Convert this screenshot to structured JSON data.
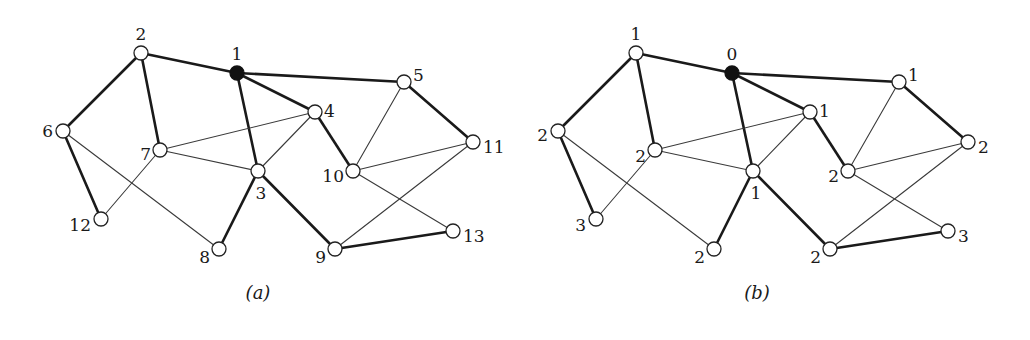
{
  "figure": {
    "panels": [
      {
        "id": "a",
        "caption": "(a)",
        "caption_pos": [
          258,
          299
        ],
        "offset_x": 0,
        "root": "1",
        "nodes": [
          {
            "id": "1",
            "x": 237,
            "y": 73,
            "label": "1",
            "lx": 237,
            "ly": 55,
            "anchor": "middle"
          },
          {
            "id": "2",
            "x": 141,
            "y": 53,
            "label": "2",
            "lx": 141,
            "ly": 35,
            "anchor": "middle"
          },
          {
            "id": "3",
            "x": 258,
            "y": 171,
            "label": "3",
            "lx": 261,
            "ly": 194,
            "anchor": "middle"
          },
          {
            "id": "4",
            "x": 315,
            "y": 112,
            "label": "4",
            "lx": 324,
            "ly": 112,
            "anchor": "start"
          },
          {
            "id": "5",
            "x": 404,
            "y": 82,
            "label": "5",
            "lx": 413,
            "ly": 76,
            "anchor": "start"
          },
          {
            "id": "6",
            "x": 63,
            "y": 131,
            "label": "6",
            "lx": 53,
            "ly": 132,
            "anchor": "end"
          },
          {
            "id": "7",
            "x": 160,
            "y": 150,
            "label": "7",
            "lx": 151,
            "ly": 155,
            "anchor": "end"
          },
          {
            "id": "8",
            "x": 219,
            "y": 249,
            "label": "8",
            "lx": 210,
            "ly": 258,
            "anchor": "end"
          },
          {
            "id": "9",
            "x": 335,
            "y": 249,
            "label": "9",
            "lx": 326,
            "ly": 258,
            "anchor": "end"
          },
          {
            "id": "10",
            "x": 353,
            "y": 171,
            "label": "10",
            "lx": 344,
            "ly": 177,
            "anchor": "end"
          },
          {
            "id": "11",
            "x": 473,
            "y": 142,
            "label": "11",
            "lx": 483,
            "ly": 148,
            "anchor": "start"
          },
          {
            "id": "12",
            "x": 101,
            "y": 219,
            "label": "12",
            "lx": 91,
            "ly": 226,
            "anchor": "end"
          },
          {
            "id": "13",
            "x": 453,
            "y": 231,
            "label": "13",
            "lx": 463,
            "ly": 237,
            "anchor": "start"
          }
        ]
      },
      {
        "id": "b",
        "caption": "(b)",
        "caption_pos": [
          757,
          299
        ],
        "offset_x": 495,
        "root": "1",
        "nodes": [
          {
            "id": "1",
            "x": 237,
            "y": 73,
            "label": "0",
            "lx": 237,
            "ly": 55,
            "anchor": "middle"
          },
          {
            "id": "2",
            "x": 141,
            "y": 53,
            "label": "1",
            "lx": 141,
            "ly": 35,
            "anchor": "middle"
          },
          {
            "id": "3",
            "x": 258,
            "y": 171,
            "label": "1",
            "lx": 261,
            "ly": 194,
            "anchor": "middle"
          },
          {
            "id": "4",
            "x": 315,
            "y": 112,
            "label": "1",
            "lx": 324,
            "ly": 112,
            "anchor": "start"
          },
          {
            "id": "5",
            "x": 404,
            "y": 82,
            "label": "1",
            "lx": 413,
            "ly": 76,
            "anchor": "start"
          },
          {
            "id": "6",
            "x": 63,
            "y": 131,
            "label": "2",
            "lx": 53,
            "ly": 136,
            "anchor": "end"
          },
          {
            "id": "7",
            "x": 160,
            "y": 150,
            "label": "2",
            "lx": 151,
            "ly": 157,
            "anchor": "end"
          },
          {
            "id": "8",
            "x": 219,
            "y": 249,
            "label": "2",
            "lx": 210,
            "ly": 258,
            "anchor": "end"
          },
          {
            "id": "9",
            "x": 335,
            "y": 249,
            "label": "2",
            "lx": 326,
            "ly": 258,
            "anchor": "end"
          },
          {
            "id": "10",
            "x": 353,
            "y": 171,
            "label": "2",
            "lx": 344,
            "ly": 177,
            "anchor": "end"
          },
          {
            "id": "11",
            "x": 473,
            "y": 142,
            "label": "2",
            "lx": 483,
            "ly": 148,
            "anchor": "start"
          },
          {
            "id": "12",
            "x": 101,
            "y": 219,
            "label": "3",
            "lx": 91,
            "ly": 226,
            "anchor": "end"
          },
          {
            "id": "13",
            "x": 453,
            "y": 231,
            "label": "3",
            "lx": 463,
            "ly": 237,
            "anchor": "start"
          }
        ]
      }
    ],
    "edges": [
      {
        "from": "2",
        "to": "1",
        "weight": "thick"
      },
      {
        "from": "2",
        "to": "6",
        "weight": "thick"
      },
      {
        "from": "2",
        "to": "7",
        "weight": "thick"
      },
      {
        "from": "1",
        "to": "5",
        "weight": "thick"
      },
      {
        "from": "1",
        "to": "4",
        "weight": "thick"
      },
      {
        "from": "1",
        "to": "3",
        "weight": "thick"
      },
      {
        "from": "4",
        "to": "10",
        "weight": "thick"
      },
      {
        "from": "5",
        "to": "11",
        "weight": "thick"
      },
      {
        "from": "6",
        "to": "12",
        "weight": "thick"
      },
      {
        "from": "3",
        "to": "8",
        "weight": "thick"
      },
      {
        "from": "3",
        "to": "9",
        "weight": "thick"
      },
      {
        "from": "9",
        "to": "13",
        "weight": "thick"
      },
      {
        "from": "6",
        "to": "8",
        "weight": "thin"
      },
      {
        "from": "7",
        "to": "4",
        "weight": "thin"
      },
      {
        "from": "7",
        "to": "3",
        "weight": "thin"
      },
      {
        "from": "7",
        "to": "12",
        "weight": "thin"
      },
      {
        "from": "4",
        "to": "3",
        "weight": "thin"
      },
      {
        "from": "5",
        "to": "10",
        "weight": "thin"
      },
      {
        "from": "10",
        "to": "11",
        "weight": "thin"
      },
      {
        "from": "10",
        "to": "13",
        "weight": "thin"
      },
      {
        "from": "11",
        "to": "9",
        "weight": "thin"
      }
    ],
    "node_radius": 7,
    "root_radius": 7
  }
}
